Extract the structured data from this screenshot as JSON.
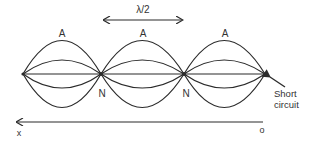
{
  "diagram": {
    "wavelength_label": "λ/2",
    "antinode_labels": [
      "A",
      "A",
      "A"
    ],
    "node_labels": [
      "N",
      "N"
    ],
    "termination_label_line1": "Short",
    "termination_label_line2": "circuit",
    "axis": {
      "start_label": "x",
      "origin_label": "o"
    },
    "colors": {
      "stroke": "#2b2b2b",
      "text": "#333333",
      "background": "#ffffff"
    }
  }
}
